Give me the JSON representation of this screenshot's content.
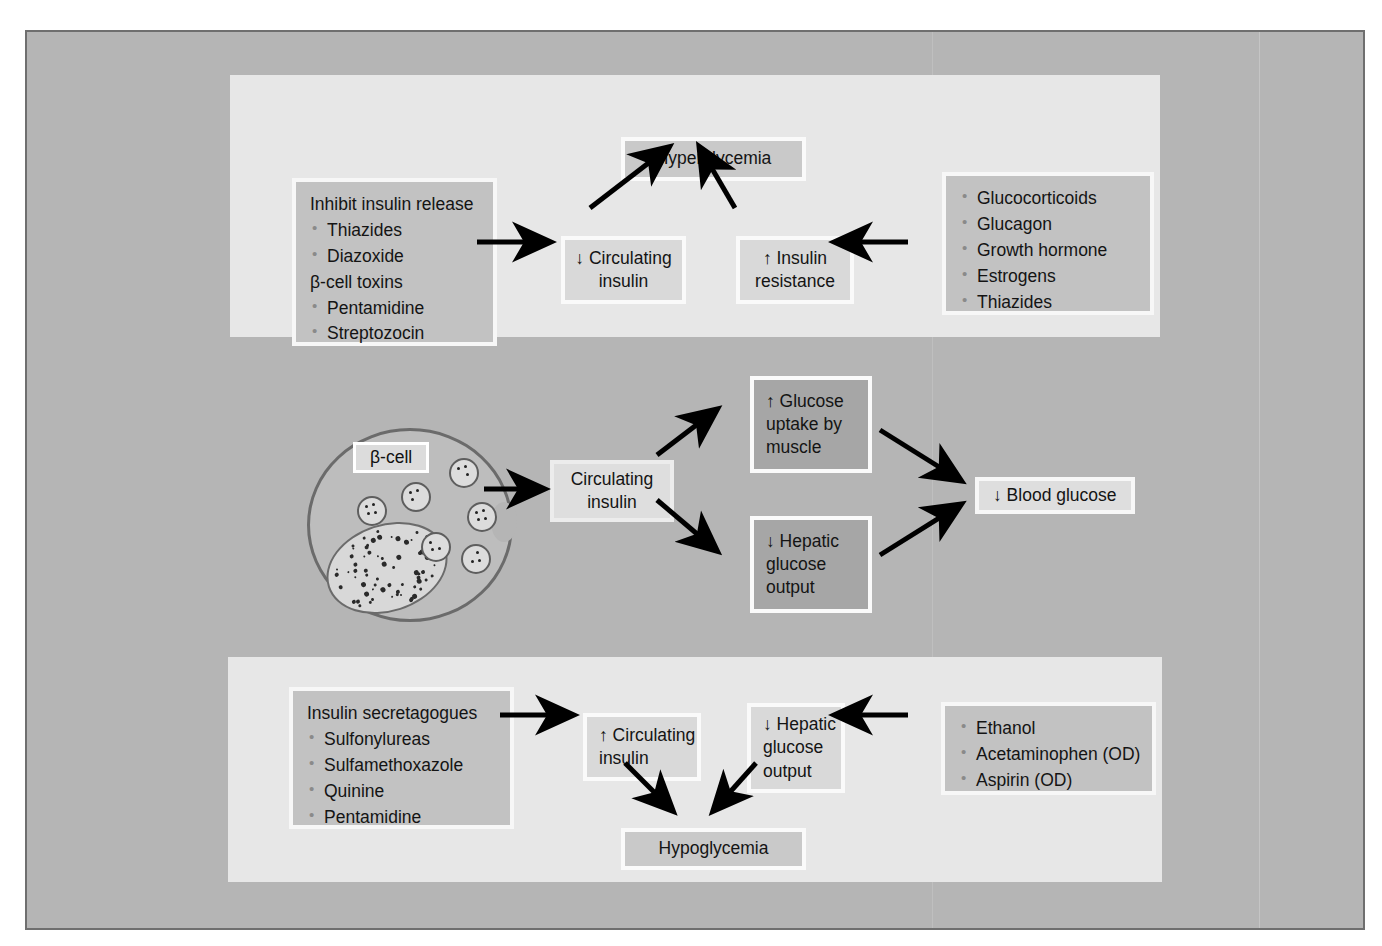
{
  "figure": {
    "background_color": "#b5b5b5",
    "panel_color": "#e7e7e7",
    "box_color": "#c9c9c9",
    "dark_box_color": "#a6a6a6"
  },
  "hyperglycemia_panel": {
    "cause_box": {
      "heading": "Inhibit insulin release",
      "items_a": [
        "Thiazides",
        "Diazoxide"
      ],
      "subheading": "β-cell toxins",
      "items_b": [
        "Pentamidine",
        "Streptozocin"
      ]
    },
    "mediator_left": {
      "line1": "↓ Circulating",
      "line2": "insulin"
    },
    "mediator_right": {
      "line1": "↑ Insulin",
      "line2": "resistance"
    },
    "outcome": "Hyperglycemia",
    "resistance_box": {
      "items": [
        "Glucocorticoids",
        "Glucagon",
        "Growth hormone",
        "Estrogens",
        "Thiazides"
      ]
    }
  },
  "physiology_panel": {
    "cell_label": "β-cell",
    "circulating_insulin": {
      "line1": "Circulating",
      "line2": "insulin"
    },
    "effect_upper": {
      "line1": "↑ Glucose",
      "line2": "uptake by",
      "line3": "muscle"
    },
    "effect_lower": {
      "line1": "↓ Hepatic",
      "line2": "glucose",
      "line3": "output"
    },
    "outcome": "↓ Blood glucose"
  },
  "hypoglycemia_panel": {
    "cause_box": {
      "heading": "Insulin secretagogues",
      "items": [
        "Sulfonylureas",
        "Sulfamethoxazole",
        "Quinine",
        "Pentamidine"
      ]
    },
    "mediator_left": {
      "line1": "↑ Circulating",
      "line2": "insulin"
    },
    "mediator_right": {
      "line1": "↓ Hepatic",
      "line2": "glucose",
      "line3": "output"
    },
    "outcome": "Hypoglycemia",
    "hepatic_box": {
      "items": [
        "Ethanol",
        "Acetaminophen (OD)",
        "Aspirin (OD)"
      ]
    }
  }
}
